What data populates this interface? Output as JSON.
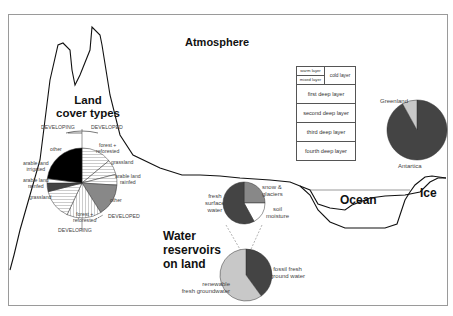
{
  "header_cut_text": "· · · · · · · · · ·",
  "titles": {
    "atmosphere": "Atmosphere",
    "land": [
      "Land",
      "cover types"
    ],
    "ocean": "Ocean",
    "ice": "Ice",
    "water": [
      "Water",
      "reservoirs",
      "on land"
    ]
  },
  "land_cover": {
    "developing_top": "DEVELOPING",
    "developed_top": "DEVELOPED",
    "developing_bottom": "DEVELOPING",
    "developed_bottom": "DEVELOPED",
    "labels": [
      "other",
      "forest +",
      "reforested",
      "grassland",
      "arable land",
      "rainfed",
      "other",
      "forest +",
      "reforested",
      "grassland",
      "arable land",
      "rainfed",
      "arable land",
      "irrigated"
    ]
  },
  "ocean_layers": {
    "warm": "warm layer",
    "mixed": "mixed layer",
    "cold": "cold layer",
    "deep": [
      "first deep layer",
      "second deep layer",
      "third deep layer",
      "fourth deep layer"
    ]
  },
  "ice_pie": {
    "labels": [
      "Greenland",
      "Antartica"
    ],
    "fractions": [
      0.08,
      0.92
    ],
    "colors": [
      "#c8c8c8",
      "#444444"
    ]
  },
  "water_top_pie": {
    "labels": [
      "fresh",
      "surface",
      "water",
      "snow &",
      "glaciers",
      "soil",
      "moisture"
    ],
    "slices": [
      {
        "name": "snow & glaciers",
        "fraction": 0.25,
        "color": "#888888"
      },
      {
        "name": "soil moisture",
        "fraction": 0.17,
        "color": "#ffffff"
      },
      {
        "name": "fresh surface water",
        "fraction": 0.58,
        "color": "#444444"
      }
    ]
  },
  "water_bottom_pie": {
    "labels": [
      "fossil fresh",
      "ground water",
      "renewable",
      "fresh groundwater"
    ],
    "slices": [
      {
        "name": "fossil fresh ground water",
        "fraction": 0.4,
        "color": "#444444"
      },
      {
        "name": "renewable fresh groundwater",
        "fraction": 0.6,
        "color": "#c8c8c8"
      }
    ]
  },
  "land_pie": {
    "slices": [
      {
        "name": "forest + reforested (developed)",
        "fraction": 0.14,
        "color": "#ffffff",
        "pattern": "hlines"
      },
      {
        "name": "grassland (developed)",
        "fraction": 0.07,
        "color": "#ffffff",
        "pattern": "hlines"
      },
      {
        "name": "arable land rainfed (developed)",
        "fraction": 0.05,
        "color": "#ffffff",
        "pattern": "hlines"
      },
      {
        "name": "other (developed)",
        "fraction": 0.15,
        "color": "#888888",
        "pattern": "none"
      },
      {
        "name": "forest + reforested (developing)",
        "fraction": 0.16,
        "color": "#ffffff",
        "pattern": "vlines"
      },
      {
        "name": "grassland (developing)",
        "fraction": 0.14,
        "color": "#ffffff",
        "pattern": "hlines"
      },
      {
        "name": "arable land rainfed (developing)",
        "fraction": 0.04,
        "color": "#444444",
        "pattern": "none"
      },
      {
        "name": "arable land irrigated (developing)",
        "fraction": 0.02,
        "color": "#ffffff",
        "pattern": "none"
      },
      {
        "name": "other (developing)",
        "fraction": 0.23,
        "color": "#000000",
        "pattern": "none"
      }
    ]
  }
}
